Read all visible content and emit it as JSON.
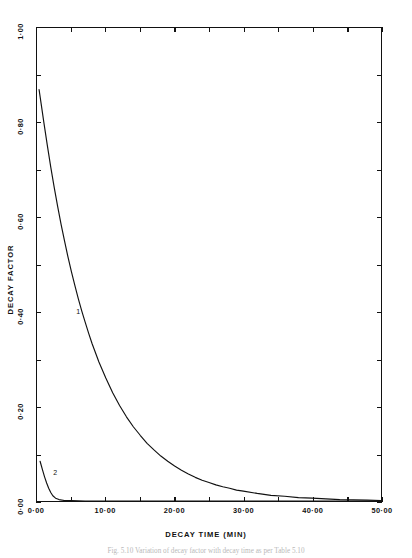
{
  "figure": {
    "caption": "Fig. 5.10 Variation of decay factor with decay time as per Table 5.10"
  },
  "chart_data": {
    "type": "line",
    "title": "",
    "xlabel": "DECAY TIME (MIN)",
    "ylabel": "DECAY FACTOR",
    "xlim": [
      0,
      50
    ],
    "ylim": [
      0,
      1.0
    ],
    "grid": false,
    "legend_position": "inline-labels",
    "x_tick_labels": [
      "0·00",
      "10·00",
      "20·00",
      "30·00",
      "40·00",
      "50·00"
    ],
    "x_tick_values": [
      0,
      10,
      20,
      30,
      40,
      50
    ],
    "x_minor_tick_values": [
      5,
      15,
      25,
      35,
      45
    ],
    "y_tick_labels": [
      "0·00",
      "0·20",
      "0·40",
      "0·60",
      "0·80",
      "1·00"
    ],
    "y_tick_values": [
      0,
      0.2,
      0.4,
      0.6,
      0.8,
      1.0
    ],
    "y_minor_tick_values": [
      0.1,
      0.3,
      0.5,
      0.7,
      0.9
    ],
    "series": [
      {
        "name": "1",
        "label": "1",
        "label_x": 5.8,
        "label_y": 0.4,
        "color": "#111111",
        "x": [
          0.3,
          0.6,
          1.0,
          1.5,
          2.0,
          2.5,
          3.0,
          3.5,
          4.0,
          4.5,
          5.0,
          5.5,
          6.0,
          6.5,
          7.0,
          7.5,
          8.0,
          9.0,
          10.0,
          11.0,
          12.0,
          13.0,
          14.0,
          15.0,
          16.0,
          17.0,
          18.0,
          19.0,
          20.0,
          21.0,
          22.0,
          23.0,
          24.0,
          25.0,
          26.0,
          27.0,
          28.0,
          29.0,
          30.0,
          32.0,
          34.0,
          36.0,
          38.0,
          40.0,
          44.0,
          48.0,
          50.0
        ],
        "y": [
          0.87,
          0.84,
          0.8,
          0.752,
          0.706,
          0.663,
          0.623,
          0.585,
          0.55,
          0.516,
          0.485,
          0.456,
          0.428,
          0.402,
          0.378,
          0.355,
          0.333,
          0.294,
          0.26,
          0.229,
          0.202,
          0.178,
          0.157,
          0.139,
          0.122,
          0.108,
          0.095,
          0.084,
          0.074,
          0.065,
          0.057,
          0.05,
          0.044,
          0.039,
          0.034,
          0.03,
          0.027,
          0.023,
          0.021,
          0.016,
          0.012,
          0.01,
          0.007,
          0.006,
          0.003,
          0.002,
          0.001
        ]
      },
      {
        "name": "2",
        "label": "2",
        "label_x": 2.5,
        "label_y": 0.062,
        "color": "#111111",
        "x": [
          0.45,
          0.8,
          1.1,
          1.4,
          1.7,
          2.0,
          2.3,
          2.7,
          3.2,
          4.0,
          5.0,
          7.0,
          10.0,
          15.0,
          20.0,
          30.0,
          40.0,
          50.0
        ],
        "y": [
          0.084,
          0.066,
          0.051,
          0.038,
          0.027,
          0.018,
          0.011,
          0.006,
          0.003,
          0.001,
          0.001,
          0.0,
          0.0,
          0.0,
          0.0,
          0.0,
          0.0,
          0.0
        ]
      }
    ]
  }
}
